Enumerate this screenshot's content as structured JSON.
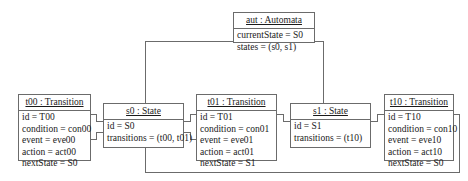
{
  "diagram": {
    "kind": "uml-object-diagram",
    "line_color": "#6b6b6b",
    "box_fill": "#ffffff",
    "text_color": "#1a1a1a"
  },
  "objects": {
    "aut": {
      "header": "aut : Automata",
      "slots": [
        "currentState = S0",
        "states = (s0, s1)"
      ]
    },
    "t00": {
      "header": "t00 : Transition",
      "slots": [
        "id = T00",
        "condition = con00",
        "event = eve00",
        "action = act00",
        "nextState = S0"
      ]
    },
    "s0": {
      "header": "s0 : State",
      "slots": [
        "id = S0",
        "transitions = (t00, t01)"
      ]
    },
    "t01": {
      "header": "t01 : Transition",
      "slots": [
        "id = T01",
        "condition = con01",
        "event = eve01",
        "action = act01",
        "nextState = S1"
      ]
    },
    "s1": {
      "header": "s1 : State",
      "slots": [
        "id = S1",
        "transitions = (t10)"
      ]
    },
    "t10": {
      "header": "t10 : Transition",
      "slots": [
        "id = T10",
        "condition = con10",
        "event = eve10",
        "action = act10",
        "nextState = S0"
      ]
    }
  }
}
